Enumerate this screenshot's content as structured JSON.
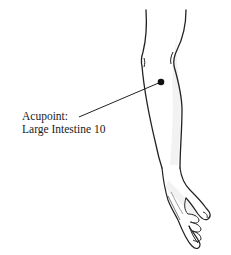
{
  "figure": {
    "annotation": {
      "line1": "Acupoint:",
      "line2": "Large Intestine 10"
    },
    "marker": {
      "x": 161,
      "y": 82,
      "radius": 3.2,
      "color": "#111111"
    },
    "leader_line": {
      "x1": 79,
      "y1": 117,
      "x2": 161,
      "y2": 82,
      "color": "#222222"
    },
    "colors": {
      "outline": "#222222",
      "shade": "#e6e6e6",
      "background": "#ffffff"
    }
  }
}
